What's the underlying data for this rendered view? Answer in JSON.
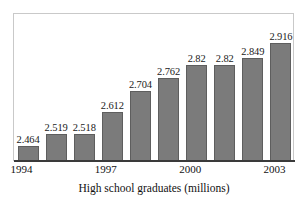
{
  "chart_data": {
    "type": "bar",
    "title": "",
    "subtitle": "",
    "xlabel": "High school graduates (millions)",
    "ylabel": "",
    "categories": [
      "1994",
      "1995",
      "1996",
      "1997",
      "1998",
      "1999",
      "2000",
      "2001",
      "2002",
      "2003"
    ],
    "values": [
      2.464,
      2.519,
      2.518,
      2.612,
      2.704,
      2.762,
      2.82,
      2.82,
      2.849,
      2.916
    ],
    "value_labels": [
      "2.464",
      "2.519",
      "2.518",
      "2.612",
      "2.704",
      "2.762",
      "2.82",
      "2.82",
      "2.849",
      "2.916"
    ],
    "tick_labels": [
      "1994",
      "",
      "",
      "1997",
      "",
      "",
      "2000",
      "",
      "",
      "2003"
    ],
    "visible_tick_labels": [
      "1994",
      "1997",
      "2000",
      "2003"
    ],
    "ylim": [
      2.4,
      2.95
    ],
    "axis_baseline_suppressed": true,
    "grid": false,
    "legend": null,
    "legend_position": "none",
    "bar_color": "#7b7b7b",
    "bar_edge_color": "#5e5e5e",
    "frame_color": "#c9c9c9",
    "axis_color": "#3a3a3a",
    "text_color": "#111111",
    "data_labels_shown": true
  },
  "figure": {
    "caption": "High school graduates (millions)",
    "background": "#ffffff"
  }
}
